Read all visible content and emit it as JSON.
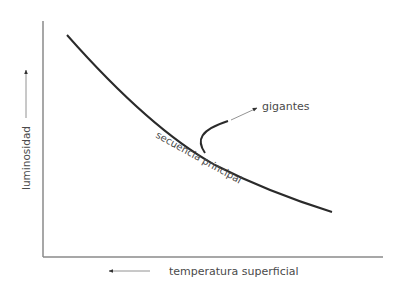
{
  "diagram": {
    "axes": {
      "y_label": "luminosidad",
      "x_label": "temperatura superficial",
      "y_arrow_direction": "up",
      "x_arrow_direction": "left"
    },
    "curves": [
      {
        "name": "secuencia principal",
        "label": "secuencia principal"
      },
      {
        "name": "gigantes",
        "label": "gigantes"
      }
    ],
    "colors": {
      "axis": "#8a8a8a",
      "curve": "#2a2a2a",
      "text": "#4a4a4a",
      "arrow": "#333333"
    }
  }
}
